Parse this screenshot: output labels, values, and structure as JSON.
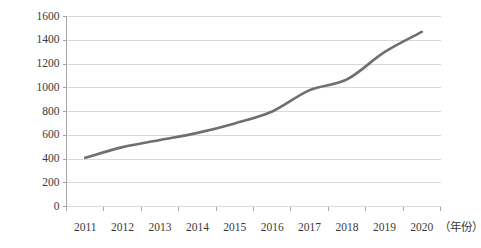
{
  "chart_data": {
    "type": "line",
    "title": "",
    "xlabel": "（年份）",
    "ylabel": "",
    "categories": [
      "2011",
      "2012",
      "2013",
      "2014",
      "2015",
      "2016",
      "2017",
      "2018",
      "2019",
      "2020"
    ],
    "values": [
      410,
      500,
      560,
      620,
      700,
      800,
      980,
      1070,
      1300,
      1470
    ],
    "series": [
      {
        "name": "",
        "values": [
          410,
          500,
          560,
          620,
          700,
          800,
          980,
          1070,
          1300,
          1470
        ]
      }
    ],
    "ylim": [
      0,
      1600
    ],
    "yticks": [
      0,
      200,
      400,
      600,
      800,
      1000,
      1200,
      1400,
      1600
    ],
    "ytick_labels": [
      "0",
      "200",
      "400",
      "600",
      "800",
      "1000",
      "1200",
      "1400",
      "1600"
    ],
    "grid": true,
    "legend": false,
    "legend_position": "none",
    "line_color": "#6f6f6f",
    "grid_color": "#d9d9d9",
    "axis_color": "#a6a6a6",
    "background_color": "#ffffff",
    "smooth": true
  }
}
